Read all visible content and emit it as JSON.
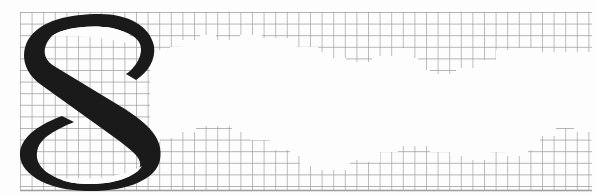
{
  "artwork": {
    "letter": "S",
    "description": "Large black ornamental serif letter S overlaid on a gray grid with an irregular white cloud-like void",
    "colors": {
      "background": "#fdfdfd",
      "grid": "#9c9c9c",
      "letter": "#1a1a1a"
    },
    "grid": {
      "origin_x": 20,
      "origin_y": 12,
      "spacing": 11.6,
      "right": 592,
      "bottom": 191
    }
  }
}
